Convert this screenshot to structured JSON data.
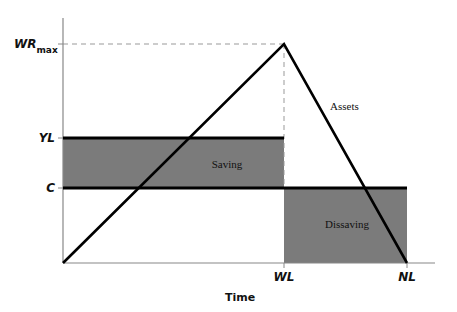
{
  "diagram": {
    "type": "life-cycle-model",
    "x_axis": {
      "title": "Time",
      "ticks": [
        {
          "label": "WL",
          "x": 284
        },
        {
          "label": "NL",
          "x": 407
        }
      ]
    },
    "y_axis": {
      "ticks": [
        {
          "label": "WR",
          "subscript": "max",
          "y": 44
        },
        {
          "label": "YL",
          "y": 138
        },
        {
          "label": "C",
          "y": 188
        }
      ]
    },
    "regions": [
      {
        "label": "Saving",
        "color": "#7b7b7b"
      },
      {
        "label": "Dissaving",
        "color": "#7b7b7b"
      }
    ],
    "curves": [
      {
        "label": "Assets",
        "color": "#000000"
      }
    ],
    "colors": {
      "fill": "#7b7b7b",
      "line": "#000000",
      "axis": "#888888",
      "dash": "#999999"
    }
  }
}
